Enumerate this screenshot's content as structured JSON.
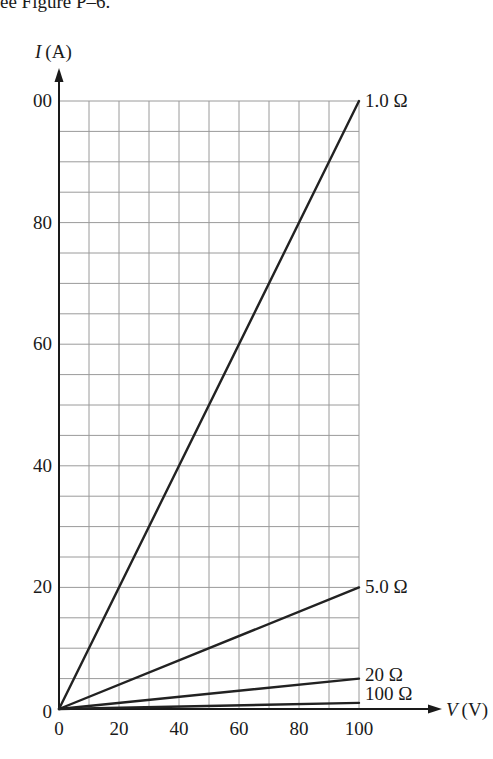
{
  "header_fragment": "ee Figure P–6.",
  "chart_data": {
    "type": "line",
    "title": "",
    "xlabel_var": "V",
    "xlabel_unit": "(V)",
    "ylabel_var": "I",
    "ylabel_unit": "(A)",
    "xlim": [
      0,
      100
    ],
    "ylim": [
      0,
      100
    ],
    "x_ticks": [
      "0",
      "20",
      "40",
      "60",
      "80",
      "100"
    ],
    "y_ticks": [
      "0",
      "20",
      "40",
      "60",
      "80",
      "00"
    ],
    "grid": true,
    "grid_x_step": 10,
    "grid_y_step": 5,
    "x": [
      0,
      100
    ],
    "series": [
      {
        "name": "1.0 Ω",
        "values": [
          0,
          100
        ]
      },
      {
        "name": "5.0 Ω",
        "values": [
          0,
          20
        ]
      },
      {
        "name": "20 Ω",
        "values": [
          0,
          5
        ]
      },
      {
        "name": "100 Ω",
        "values": [
          0,
          1
        ]
      }
    ]
  }
}
